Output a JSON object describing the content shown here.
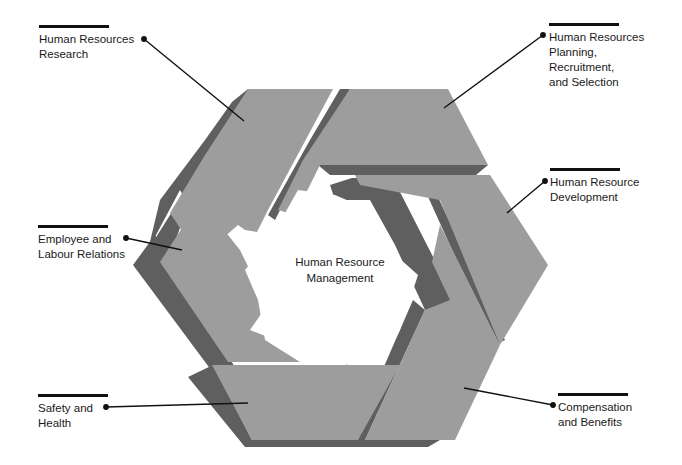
{
  "diagram": {
    "center": {
      "lines": [
        "Human Resource",
        "Management"
      ]
    },
    "colors": {
      "face": "#9d9d9d",
      "shadow": "#5f5f5f",
      "leader": "#111111",
      "background": "#ffffff"
    },
    "labels": [
      {
        "id": "hr-research",
        "lines": [
          "Human Resources",
          "Research"
        ]
      },
      {
        "id": "hr-planning",
        "lines": [
          "Human Resources",
          "Planning,",
          "Recruitment,",
          "and Selection"
        ]
      },
      {
        "id": "hr-development",
        "lines": [
          "Human Resource",
          "Development"
        ]
      },
      {
        "id": "employee-relations",
        "lines": [
          "Employee and",
          "Labour Relations"
        ]
      },
      {
        "id": "safety-health",
        "lines": [
          "Safety and",
          "Health"
        ]
      },
      {
        "id": "compensation-benefits",
        "lines": [
          "Compensation",
          "and Benefits"
        ]
      }
    ]
  }
}
